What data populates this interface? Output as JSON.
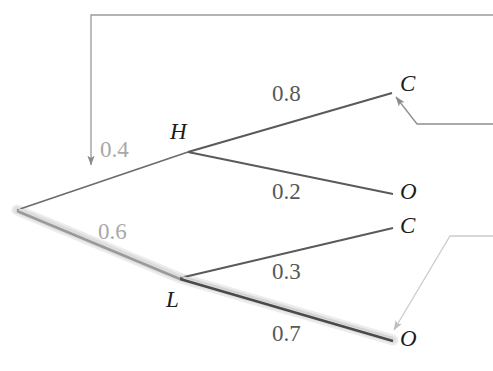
{
  "figure": {
    "type": "probability-tree-diagram",
    "width": 493,
    "height": 371,
    "background": "#ffffff"
  },
  "colors": {
    "branch_dark": "#5a5a5a",
    "branch_highlight_core": "#4a4a4a",
    "branch_highlight_glow": "#c9c9c9",
    "label_dark": "#585858",
    "label_light": "#a8a8a8",
    "node_text": "#1c1c1c",
    "annotation_arrow_dark": "#8a8a8a",
    "annotation_arrow_light": "#c4c4c4"
  },
  "nodes": [
    {
      "id": "root",
      "label": "",
      "x": 17,
      "y": 210,
      "label_x": 0,
      "label_y": 0,
      "style": "none"
    },
    {
      "id": "H",
      "label": "H",
      "x": 188,
      "y": 152,
      "label_x": 170,
      "label_y": 120,
      "style": "italic"
    },
    {
      "id": "L",
      "label": "L",
      "x": 180,
      "y": 278,
      "label_x": 166,
      "label_y": 288,
      "style": "italic"
    },
    {
      "id": "HC",
      "label": "C",
      "x": 392,
      "y": 91,
      "label_x": 400,
      "label_y": 72,
      "style": "italic"
    },
    {
      "id": "HO",
      "label": "O",
      "x": 393,
      "y": 194,
      "label_x": 400,
      "label_y": 180,
      "style": "italic"
    },
    {
      "id": "LC",
      "label": "C",
      "x": 393,
      "y": 227,
      "label_x": 400,
      "label_y": 214,
      "style": "italic"
    },
    {
      "id": "LO",
      "label": "O",
      "x": 393,
      "y": 340,
      "label_x": 400,
      "label_y": 327,
      "style": "italic"
    }
  ],
  "branches": [
    {
      "id": "root-H",
      "from": "root",
      "to": "H",
      "probability": "0.4",
      "label_x": 100,
      "label_y": 138,
      "label_tone": "light",
      "highlighted": false
    },
    {
      "id": "root-L",
      "from": "root",
      "to": "L",
      "probability": "0.6",
      "label_x": 98,
      "label_y": 220,
      "label_tone": "light",
      "highlighted": true
    },
    {
      "id": "H-C",
      "from": "H",
      "to": "HC",
      "probability": "0.8",
      "label_x": 272,
      "label_y": 82,
      "label_tone": "dark",
      "highlighted": false
    },
    {
      "id": "H-O",
      "from": "H",
      "to": "HO",
      "probability": "0.2",
      "label_x": 272,
      "label_y": 180,
      "label_tone": "dark",
      "highlighted": false
    },
    {
      "id": "L-C",
      "from": "L",
      "to": "LC",
      "probability": "0.3",
      "label_x": 272,
      "label_y": 260,
      "label_tone": "dark",
      "highlighted": false
    },
    {
      "id": "L-O",
      "from": "L",
      "to": "LO",
      "probability": "0.7",
      "label_x": 272,
      "label_y": 322,
      "label_tone": "dark",
      "highlighted": true
    }
  ],
  "highlighted_path": [
    "root",
    "L",
    "LO"
  ],
  "annotations": [
    {
      "id": "callout-root-H",
      "tone": "dark",
      "points": "493,15 91,15 91,167",
      "arrow_at": {
        "x": 91,
        "y": 169,
        "direction": "down"
      },
      "target": "root-H branch"
    },
    {
      "id": "callout-HC-node",
      "tone": "dark",
      "points": "493,124 417,124 395,95",
      "arrow_at": {
        "x": 392,
        "y": 91,
        "direction": "up-left"
      },
      "target": "HC node"
    },
    {
      "id": "callout-LO-node",
      "tone": "light",
      "points": "493,236 450,236 392,334",
      "arrow_at": {
        "x": 389,
        "y": 339,
        "direction": "down-left"
      },
      "target": "LO node"
    }
  ]
}
